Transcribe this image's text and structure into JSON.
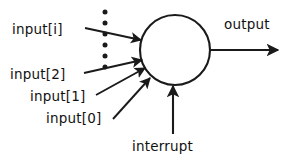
{
  "diagram": {
    "node": {
      "shape": "circle",
      "cx": 175,
      "cy": 50,
      "r": 35,
      "stroke_color": "#1a1a1a",
      "fill_color": "#ffffff"
    },
    "labels": {
      "input_i": "input[i]",
      "input_2": "input[2]",
      "input_1": "input[1]",
      "input_0": "input[0]",
      "interrupt": "interrupt",
      "output": "output"
    },
    "ellipsis": {
      "name": "vertical-ellipsis",
      "dot_count": 6,
      "color": "#1a1a1a"
    },
    "arrows": {
      "input_i": {
        "from": [
          85,
          28
        ],
        "to": [
          141,
          40
        ]
      },
      "input_2": {
        "from": [
          84,
          73
        ],
        "to": [
          142,
          60
        ]
      },
      "input_1": {
        "from": [
          96,
          95
        ],
        "to": [
          145,
          68
        ]
      },
      "input_0": {
        "from": [
          113,
          119
        ],
        "to": [
          150,
          78
        ]
      },
      "interrupt": {
        "from": [
          173,
          134
        ],
        "to": [
          173,
          86
        ]
      },
      "output": {
        "from": [
          210,
          50
        ],
        "to": [
          278,
          50
        ]
      }
    },
    "colors": {
      "ink": "#1a1a1a",
      "background": "#ffffff"
    }
  }
}
